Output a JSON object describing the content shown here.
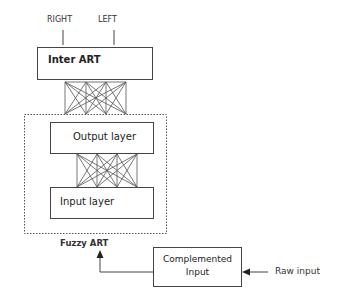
{
  "diagram": {
    "top_labels": {
      "right": "RIGHT",
      "left": "LEFT"
    },
    "inter_art": {
      "label": "Inter ART"
    },
    "fuzzy_art": {
      "label": "Fuzzy ART",
      "output_layer": {
        "label": "Output layer"
      },
      "input_layer": {
        "label": "Input layer"
      }
    },
    "complemented_input": {
      "line1": "Complemented",
      "line2": "Input"
    },
    "raw_input": {
      "label": "Raw input"
    },
    "colors": {
      "stroke": "#444444",
      "text": "#222222",
      "background": "#ffffff"
    }
  }
}
